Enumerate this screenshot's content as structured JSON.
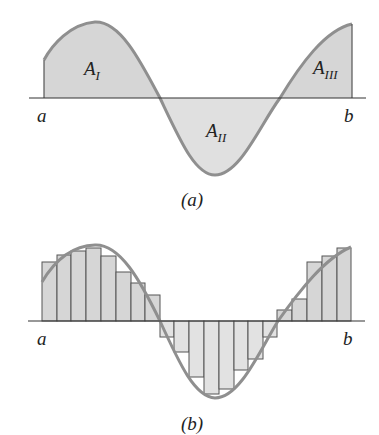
{
  "panel_a": {
    "caption": "(a)",
    "label_left": "a",
    "label_right": "b",
    "regions": [
      {
        "name": "A",
        "sub": "I"
      },
      {
        "name": "A",
        "sub": "II"
      },
      {
        "name": "A",
        "sub": "III"
      }
    ]
  },
  "panel_b": {
    "caption": "(b)",
    "label_left": "a",
    "label_right": "b",
    "bars_x": [
      42,
      57,
      71,
      86,
      101,
      116,
      131,
      145,
      160,
      174,
      189,
      204,
      219,
      234,
      248,
      263,
      277,
      292,
      307,
      322,
      337,
      351
    ],
    "bars_top": [
      262,
      255,
      251,
      248,
      256,
      272,
      283,
      295,
      337,
      352,
      377,
      394,
      389,
      370,
      359,
      337,
      310,
      299,
      262,
      256,
      248
    ],
    "axis_y": 321
  },
  "colors": {
    "fill": "#d6d6d6",
    "fill_light": "#e2e2e2",
    "curve": "#8f8f8f",
    "axis": "#333333",
    "bar_edge": "#555555"
  }
}
